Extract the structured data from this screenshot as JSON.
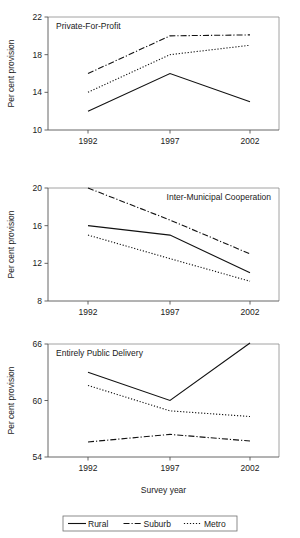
{
  "figure": {
    "width": 300,
    "height": 538,
    "y_axis_label": "Per cent provision",
    "x_axis_label": "Survey year",
    "background": "#ffffff",
    "line_color": "#111111"
  },
  "legend": {
    "position": "bottom-center",
    "entries": [
      {
        "label": "Rural",
        "style": "solid"
      },
      {
        "label": "Suburb",
        "style": "dash-dot"
      },
      {
        "label": "Metro",
        "style": "dotted"
      }
    ]
  },
  "chart_data": [
    {
      "type": "line",
      "title": "Private-For-Profit",
      "xlabel": "",
      "ylabel": "Per cent provision",
      "x": [
        "1992",
        "1997",
        "2002"
      ],
      "categories": [
        "1992",
        "1997",
        "2002"
      ],
      "ylim": [
        10,
        22
      ],
      "yticks": [
        10,
        14,
        18,
        22
      ],
      "ytick_labels": [
        "10",
        "14",
        "18",
        "22"
      ],
      "grid": false,
      "series": [
        {
          "name": "Rural",
          "style": "solid",
          "values": [
            12.0,
            16.0,
            13.0
          ]
        },
        {
          "name": "Suburb",
          "style": "dash-dot",
          "values": [
            16.0,
            20.0,
            20.1
          ]
        },
        {
          "name": "Metro",
          "style": "dotted",
          "values": [
            14.0,
            18.0,
            19.0
          ]
        }
      ]
    },
    {
      "type": "line",
      "title": "Inter-Municipal Cooperation",
      "xlabel": "",
      "ylabel": "Per cent provision",
      "x": [
        "1992",
        "1997",
        "2002"
      ],
      "categories": [
        "1992",
        "1997",
        "2002"
      ],
      "ylim": [
        8,
        20
      ],
      "yticks": [
        8,
        12,
        16,
        20
      ],
      "ytick_labels": [
        "8",
        "12",
        "16",
        "20"
      ],
      "grid": false,
      "series": [
        {
          "name": "Rural",
          "style": "solid",
          "values": [
            16.0,
            15.0,
            11.0
          ]
        },
        {
          "name": "Suburb",
          "style": "dash-dot",
          "values": [
            20.0,
            16.6,
            13.0
          ]
        },
        {
          "name": "Metro",
          "style": "dotted",
          "values": [
            15.0,
            12.5,
            10.1
          ]
        }
      ]
    },
    {
      "type": "line",
      "title": "Entirely Public Delivery",
      "xlabel": "Survey year",
      "ylabel": "Per cent provision",
      "x": [
        "1992",
        "1997",
        "2002"
      ],
      "categories": [
        "1992",
        "1997",
        "2002"
      ],
      "ylim": [
        54,
        66
      ],
      "yticks": [
        54,
        60,
        66
      ],
      "ytick_labels": [
        "54",
        "60",
        "66"
      ],
      "grid": false,
      "series": [
        {
          "name": "Rural",
          "style": "solid",
          "values": [
            63.0,
            60.0,
            66.1
          ]
        },
        {
          "name": "Suburb",
          "style": "dash-dot",
          "values": [
            55.6,
            56.4,
            55.7
          ]
        },
        {
          "name": "Metro",
          "style": "dotted",
          "values": [
            61.6,
            58.9,
            58.3
          ]
        }
      ]
    }
  ]
}
